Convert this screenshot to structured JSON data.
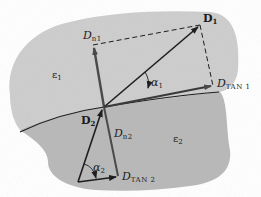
{
  "diagram": {
    "title": "",
    "colors": {
      "background": "#ffffff",
      "medium1_shade": "#c9c9c9",
      "medium2_shade": "#b5b5b5",
      "line": "#1e1e1e",
      "normal_vector": "#5a5a5a"
    },
    "regions": {
      "medium1": {
        "symbol": "ε",
        "sub": "1"
      },
      "medium2": {
        "symbol": "ε",
        "sub": "2"
      }
    },
    "vectors": {
      "D1": {
        "symbol": "D",
        "sub": "1"
      },
      "Dn1": {
        "symbol": "D",
        "sub": "n1"
      },
      "Dtan1": {
        "symbol": "D",
        "sub": "TAN 1"
      },
      "D2": {
        "symbol": "D",
        "sub": "2"
      },
      "Dn2": {
        "symbol": "D",
        "sub": "n2"
      },
      "Dtan2": {
        "symbol": "D",
        "sub": "TAN 2"
      }
    },
    "angles": {
      "alpha1": {
        "symbol": "α",
        "sub": "1"
      },
      "alpha2": {
        "symbol": "α",
        "sub": "2"
      }
    }
  }
}
